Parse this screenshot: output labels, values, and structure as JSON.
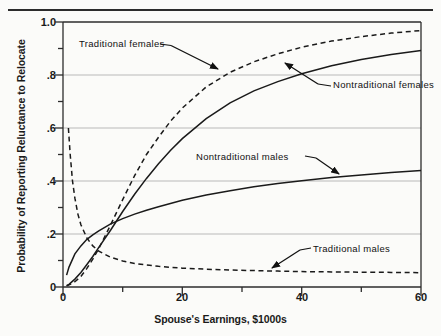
{
  "chart_data": {
    "type": "line",
    "title": "",
    "xlabel": "Spouse's Earnings, $1000s",
    "ylabel": "Probability of Reporting Reluctance to Relocate",
    "xlim": [
      0,
      60
    ],
    "ylim": [
      0,
      1.0
    ],
    "xticks": [
      0,
      10,
      20,
      30,
      40,
      50,
      60
    ],
    "xtick_labels": [
      "0",
      "",
      "20",
      "",
      "40",
      "",
      "60"
    ],
    "yticks": [
      0,
      0.1,
      0.2,
      0.3,
      0.4,
      0.5,
      0.6,
      0.7,
      0.8,
      0.9,
      1.0
    ],
    "ytick_labels": [
      "0",
      "",
      ".2",
      "",
      ".4",
      "",
      ".6",
      "",
      ".8",
      "",
      "1.0"
    ],
    "grid": "horizontal-major",
    "gridlines_y": [
      0.2,
      0.4,
      0.6,
      0.8
    ],
    "legend_position": "inline-annotations",
    "series": [
      {
        "name": "Traditional females",
        "style": "dashed",
        "x": [
          0.6,
          1,
          2,
          3,
          4,
          5,
          6,
          8,
          10,
          12,
          14,
          16,
          18,
          20,
          24,
          28,
          32,
          36,
          40,
          45,
          50,
          55,
          60
        ],
        "values": [
          0.005,
          0.008,
          0.02,
          0.04,
          0.07,
          0.105,
          0.145,
          0.235,
          0.33,
          0.42,
          0.5,
          0.565,
          0.625,
          0.675,
          0.755,
          0.81,
          0.85,
          0.88,
          0.905,
          0.928,
          0.945,
          0.958,
          0.968
        ]
      },
      {
        "name": "Nontraditional females",
        "style": "solid",
        "x": [
          0.6,
          1,
          2,
          3,
          4,
          5,
          6,
          8,
          10,
          12,
          14,
          16,
          18,
          20,
          24,
          28,
          32,
          36,
          40,
          45,
          50,
          55,
          60
        ],
        "values": [
          0.005,
          0.01,
          0.03,
          0.055,
          0.085,
          0.115,
          0.15,
          0.215,
          0.285,
          0.35,
          0.41,
          0.465,
          0.515,
          0.56,
          0.635,
          0.695,
          0.74,
          0.775,
          0.805,
          0.835,
          0.858,
          0.877,
          0.892
        ]
      },
      {
        "name": "Nontraditional males",
        "style": "solid",
        "x": [
          0.6,
          1,
          2,
          3,
          4,
          5,
          6,
          8,
          10,
          12,
          14,
          16,
          20,
          24,
          28,
          32,
          36,
          40,
          45,
          50,
          55,
          60
        ],
        "values": [
          0.045,
          0.075,
          0.125,
          0.155,
          0.18,
          0.197,
          0.212,
          0.238,
          0.258,
          0.275,
          0.29,
          0.303,
          0.327,
          0.347,
          0.363,
          0.378,
          0.39,
          0.401,
          0.413,
          0.423,
          0.432,
          0.44
        ]
      },
      {
        "name": "Traditional males",
        "style": "dashed",
        "x": [
          0.9,
          1.2,
          1.6,
          2,
          2.5,
          3,
          4,
          5,
          6,
          8,
          10,
          12,
          14,
          16,
          20,
          24,
          28,
          32,
          36,
          40,
          45,
          50,
          55,
          60
        ],
        "values": [
          0.6,
          0.5,
          0.4,
          0.335,
          0.275,
          0.235,
          0.185,
          0.155,
          0.135,
          0.112,
          0.098,
          0.089,
          0.083,
          0.078,
          0.071,
          0.067,
          0.064,
          0.062,
          0.06,
          0.058,
          0.057,
          0.056,
          0.055,
          0.054
        ]
      }
    ],
    "annotations": [
      {
        "text": "Traditional females",
        "points_to": "traditional-females-curve"
      },
      {
        "text": "Nontraditional females",
        "points_to": "nontraditional-females-curve"
      },
      {
        "text": "Nontraditional males",
        "points_to": "nontraditional-males-curve"
      },
      {
        "text": "Traditional males",
        "points_to": "traditional-males-curve"
      }
    ],
    "colors": {
      "axis": "#2c2c2c",
      "grid": "#b8b8b8",
      "curve": "#1a1a1a",
      "background": "#fbfbf9"
    }
  }
}
